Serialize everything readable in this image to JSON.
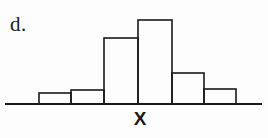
{
  "figure": {
    "panel_label": "d.",
    "background_color": "#fdfdfd",
    "stroke_color": "#1a1a1a"
  },
  "chart_data": {
    "type": "bar",
    "title": "d.",
    "subtitle": "",
    "xlabel": "X",
    "ylabel": "",
    "categories": [
      "1",
      "2",
      "3",
      "4",
      "5",
      "6"
    ],
    "values": [
      11,
      14,
      66,
      84,
      31,
      15
    ],
    "bar_edges_px": [
      39,
      71,
      104,
      138,
      172,
      204,
      236
    ],
    "bar_tops_px": [
      93,
      90,
      38,
      20,
      73,
      89
    ],
    "baseline_y_px": 104,
    "axis_x_start_px": 5,
    "axis_x_end_px": 262,
    "ylim": [
      0,
      100
    ],
    "grid": false,
    "legend": false,
    "legend_position": "none",
    "annotations": [
      "d."
    ]
  }
}
